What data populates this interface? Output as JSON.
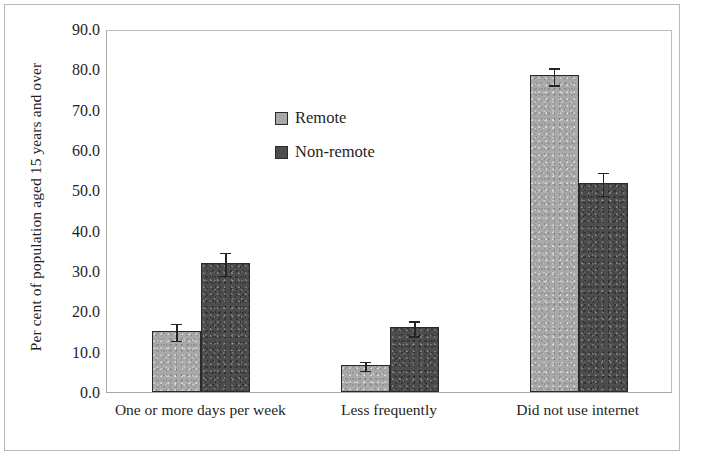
{
  "chart_data": {
    "type": "bar",
    "title": "",
    "subtitle": "",
    "xlabel": "",
    "ylabel": "Per cent of population aged 15 years and over",
    "categories": [
      "One or more days per week",
      "Less frequently",
      "Did not use internet"
    ],
    "series": [
      {
        "name": "Remote",
        "color": "#a9a9a9",
        "values": [
          15.1,
          6.7,
          78.5
        ],
        "errors": [
          2.3,
          1.3,
          2.3
        ]
      },
      {
        "name": "Non-remote",
        "color": "#4d4d4d",
        "values": [
          32.0,
          16.0,
          51.8
        ],
        "errors": [
          3.0,
          2.0,
          3.0
        ]
      }
    ],
    "ylim": [
      0.0,
      90.0
    ],
    "ytick_values": [
      0.0,
      10.0,
      20.0,
      30.0,
      40.0,
      50.0,
      60.0,
      70.0,
      80.0,
      90.0
    ],
    "ytick_labels": [
      "0.0",
      "10.0",
      "20.0",
      "30.0",
      "40.0",
      "50.0",
      "60.0",
      "70.0",
      "80.0",
      "90.0"
    ],
    "grid": false,
    "legend_position": "upper-left-inside",
    "error_bars": true
  },
  "legend": {
    "items": [
      {
        "label": "Remote",
        "swatch": "remote"
      },
      {
        "label": "Non-remote",
        "swatch": "nonremote"
      }
    ]
  }
}
